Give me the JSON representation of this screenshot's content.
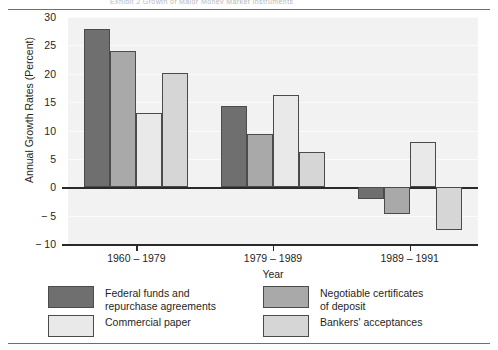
{
  "figure": {
    "clipped_header": "Exhibit 2  Growth of Major Money Market Instruments",
    "background": "#f2f2f2"
  },
  "chart_data": {
    "type": "bar",
    "title": "",
    "xlabel": "Year",
    "ylabel": "Annual Growth Rates (Percent)",
    "categories": [
      "1960 – 1979",
      "1979 – 1989",
      "1989 – 1991"
    ],
    "ylim": [
      -10,
      30
    ],
    "yticks": [
      30,
      25,
      20,
      15,
      10,
      5,
      0,
      -5,
      -10
    ],
    "ytick_labels": [
      "30",
      "25",
      "20",
      "15",
      "10",
      "5",
      "0",
      "− 5",
      "− 10"
    ],
    "grid": true,
    "legend_position": "bottom",
    "series": [
      {
        "name": "Federal funds and\nrepurchase agreements",
        "color": "#6f6f6f",
        "values": [
          27.8,
          14.3,
          -2.0
        ]
      },
      {
        "name": "Negotiable certificates\nof deposit",
        "color": "#a9a9a9",
        "values": [
          24.0,
          9.4,
          -4.8
        ]
      },
      {
        "name": "Commercial paper",
        "color": "#e9e9e9",
        "values": [
          13.0,
          16.2,
          7.9
        ]
      },
      {
        "name": "Bankers' acceptances",
        "color": "#d6d6d6",
        "values": [
          20.2,
          6.2,
          -7.5
        ]
      }
    ]
  },
  "colors": {
    "axis": "#2a2a2a",
    "rule": "#6e6e6e",
    "bar_outline": "#4b4b4b",
    "plot_bg": "#f2f2f2",
    "gridline": "#fbfbfb"
  }
}
